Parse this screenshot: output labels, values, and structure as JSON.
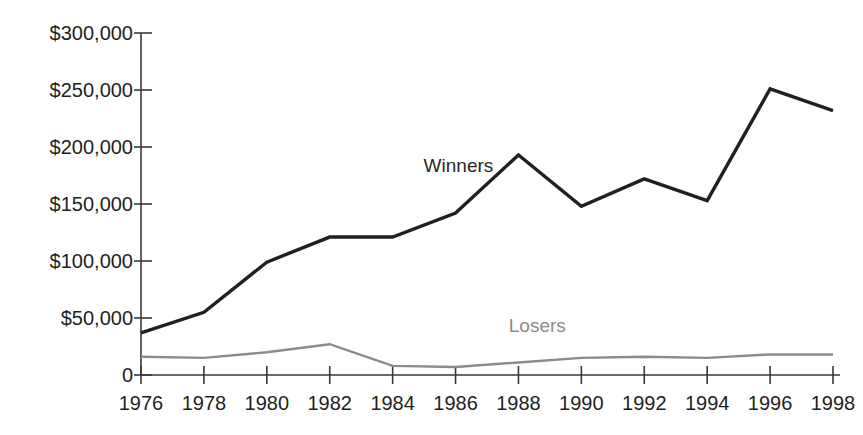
{
  "chart_data": {
    "type": "line",
    "title": "",
    "subtitle": "",
    "xlabel": "",
    "ylabel": "",
    "x": [
      1976,
      1978,
      1980,
      1982,
      1984,
      1986,
      1988,
      1990,
      1992,
      1994,
      1996,
      1998
    ],
    "categories": [
      "1976",
      "1978",
      "1980",
      "1982",
      "1984",
      "1986",
      "1988",
      "1990",
      "1992",
      "1994",
      "1996",
      "1998"
    ],
    "xlim": [
      1976,
      1998
    ],
    "ylim": [
      0,
      300000
    ],
    "grid": false,
    "legend_position": "inline-annotation",
    "y_tick_values": [
      0,
      50000,
      100000,
      150000,
      200000,
      250000,
      300000
    ],
    "y_tick_labels": [
      "0",
      "$50,000",
      "$100,000",
      "$150,000",
      "$200,000",
      "$250,000",
      "$300,000"
    ],
    "x_tick_labels": [
      "1976",
      "1978",
      "1980",
      "1982",
      "1984",
      "1986",
      "1988",
      "1990",
      "1992",
      "1994",
      "1996",
      "1998"
    ],
    "series": [
      {
        "name": "Winners",
        "color": "#231f1f",
        "line_width": 3.4,
        "values": [
          37000,
          55000,
          99000,
          121000,
          121000,
          142000,
          193000,
          148000,
          172000,
          153000,
          251000,
          232000
        ],
        "label": "Winners",
        "label_x": 1987.2,
        "label_y": 178000
      },
      {
        "name": "Losers",
        "color": "#8b8b8b",
        "line_width": 2.4,
        "values": [
          16000,
          15000,
          20000,
          27000,
          8000,
          7000,
          11000,
          15000,
          16000,
          15000,
          18000,
          18000
        ],
        "label": "Losers",
        "label_x": 1988.6,
        "label_y": 38000
      }
    ],
    "annotations": [
      {
        "text": "Winners",
        "series": "Winners"
      },
      {
        "text": "Losers",
        "series": "Losers"
      }
    ],
    "colors": {
      "winners_line": "#231f1f",
      "losers_line": "#8b8b8b",
      "axis": "#3a3737",
      "tick_text": "#221f1f",
      "background": "#ffffff"
    }
  }
}
